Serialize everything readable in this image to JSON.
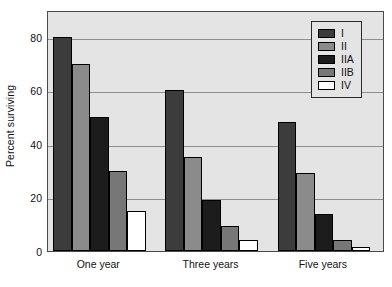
{
  "chart_data": {
    "type": "bar",
    "title": "",
    "xlabel": "",
    "ylabel": "Percent surviving",
    "categories": [
      "One year",
      "Three years",
      "Five years"
    ],
    "series": [
      {
        "name": "I",
        "color": "#3c3c3c",
        "values": [
          80,
          60,
          48
        ]
      },
      {
        "name": "II",
        "color": "#8b8b8b",
        "values": [
          70,
          35,
          29
        ]
      },
      {
        "name": "IIA",
        "color": "#1c1c1c",
        "values": [
          50,
          19,
          14
        ]
      },
      {
        "name": "IIB",
        "color": "#777777",
        "values": [
          30,
          9.5,
          4
        ]
      },
      {
        "name": "IV",
        "color": "#ffffff",
        "values": [
          15,
          4,
          1.5
        ]
      }
    ],
    "ylim": [
      0,
      90
    ],
    "yticks": [
      0,
      20,
      40,
      60,
      80
    ],
    "ytick_labels": [
      "0",
      "20",
      "40",
      "60",
      "80"
    ],
    "grid": true,
    "legend_position": "top-right",
    "legend_entries": [
      "I",
      "II",
      "IIA",
      "IIB",
      "IV"
    ],
    "plot_background": "#e4e4e4",
    "gridline_color": "#8e8e8e",
    "axis_color": "#4a4a4a",
    "bar_edge_color": "#000000"
  }
}
